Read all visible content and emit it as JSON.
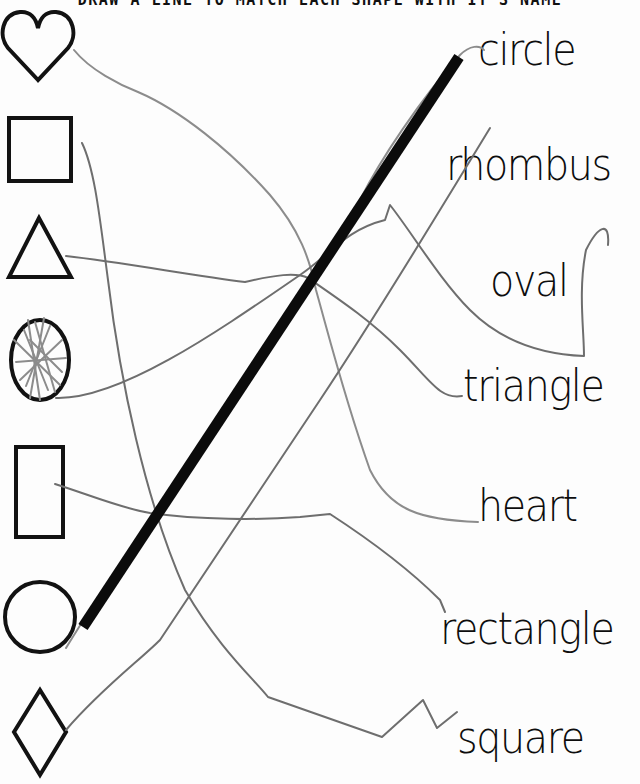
{
  "worksheet": {
    "title": "DRAW A LINE TO MATCH EACH SHAPE WITH IT'S NAME",
    "shapes": [
      {
        "name": "heart",
        "icon": "heart-outline"
      },
      {
        "name": "square",
        "icon": "square-outline"
      },
      {
        "name": "triangle",
        "icon": "triangle-outline"
      },
      {
        "name": "oval",
        "icon": "oval-outline",
        "note": "scribbled over"
      },
      {
        "name": "rectangle",
        "icon": "rectangle-outline"
      },
      {
        "name": "circle",
        "icon": "circle-outline"
      },
      {
        "name": "rhombus",
        "icon": "rhombus-outline"
      }
    ],
    "words": [
      {
        "label": "circle"
      },
      {
        "label": "rhombus"
      },
      {
        "label": "oval"
      },
      {
        "label": "triangle"
      },
      {
        "label": "heart"
      },
      {
        "label": "rectangle"
      },
      {
        "label": "square"
      }
    ],
    "colors": {
      "ink": "#121212",
      "pencil": "#6e6e6e",
      "marker": "#0b0b0b",
      "paper": "#fdfdfd"
    }
  }
}
